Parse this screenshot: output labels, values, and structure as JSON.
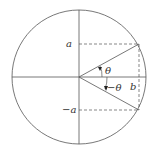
{
  "diagram": {
    "labels": {
      "a": "a",
      "neg_a": "−a",
      "theta": "θ",
      "neg_theta": "−θ",
      "b": "b"
    },
    "colors": {
      "stroke": "#555555",
      "text": "#333333",
      "background": "#ffffff"
    }
  }
}
